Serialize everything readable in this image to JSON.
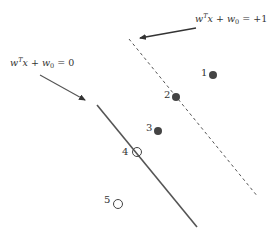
{
  "diagram": {
    "title": "",
    "labels": {
      "margin_line": {
        "w": "w",
        "T": "T",
        "x": "x",
        "plus": "+",
        "w0": "w",
        "zero": "0",
        "rhs": "= +1"
      },
      "decision_line": {
        "w": "w",
        "T": "T",
        "x": "x",
        "plus": "+",
        "w0": "w",
        "zero": "0",
        "rhs": "= 0"
      }
    },
    "points": [
      {
        "id": "1",
        "x": 213,
        "y": 75,
        "filled": true
      },
      {
        "id": "2",
        "x": 176,
        "y": 97,
        "filled": true
      },
      {
        "id": "3",
        "x": 158,
        "y": 131,
        "filled": true
      },
      {
        "id": "4",
        "x": 137,
        "y": 152,
        "filled": false
      },
      {
        "id": "5",
        "x": 118,
        "y": 204,
        "filled": false
      }
    ],
    "lines": {
      "decision": {
        "style": "solid",
        "x1": 97,
        "y1": 105,
        "x2": 197,
        "y2": 227
      },
      "margin": {
        "style": "dashed",
        "x1": 129,
        "y1": 39,
        "x2": 258,
        "y2": 197
      }
    },
    "colors": {
      "line": "#555555",
      "point": "#444444",
      "text": "#333333"
    }
  }
}
